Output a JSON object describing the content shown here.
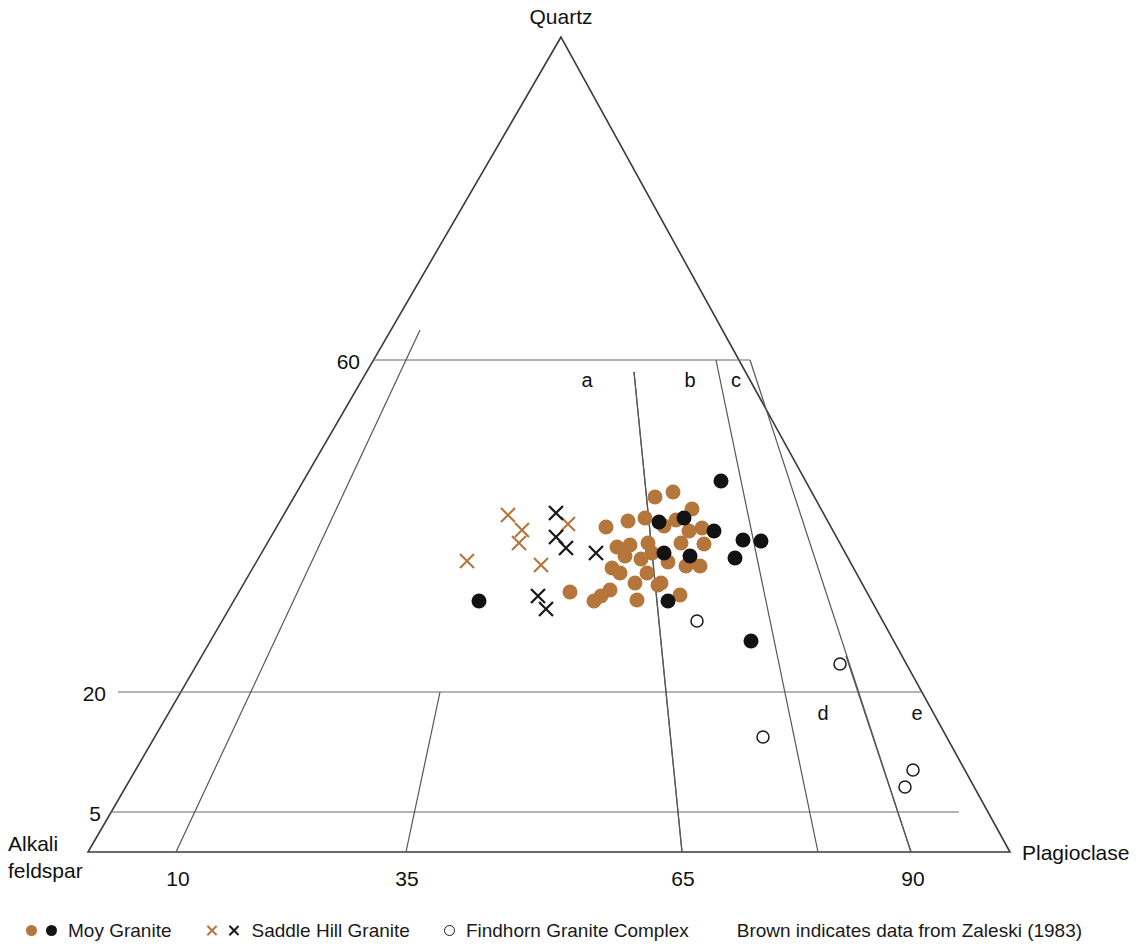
{
  "vertices": {
    "top": "Quartz",
    "bottom_left_line1": "Alkali",
    "bottom_left_line2": "feldspar",
    "bottom_right": "Plagioclase"
  },
  "axis_ticks": {
    "left": [
      "60",
      "20",
      "5"
    ],
    "bottom": [
      "10",
      "35",
      "65",
      "90"
    ]
  },
  "field_labels": [
    "a",
    "b",
    "c",
    "d",
    "e"
  ],
  "legend": {
    "items": [
      {
        "label": "Moy Granite",
        "markers": [
          "brown-filled-circle",
          "black-filled-circle"
        ]
      },
      {
        "label": "Saddle Hill Granite",
        "markers": [
          "brown-x",
          "black-x"
        ]
      },
      {
        "label": "Findhorn Granite Complex",
        "markers": [
          "open-circle"
        ]
      }
    ],
    "note": "Brown indicates data from Zaleski (1983)"
  },
  "colors": {
    "brown": "#b5763c",
    "black": "#121212",
    "line": "#3a3a3a",
    "grid": "#6b6b6b",
    "background": "#ffffff"
  },
  "chart_data": {
    "type": "scatter",
    "title": "",
    "subtitle": "",
    "plot_kind": "ternary QAP (Streckeisen) diagram",
    "apices": {
      "top": "Quartz",
      "left": "Alkali feldspar",
      "right": "Plagioclase"
    },
    "quartz_gridlines": [
      60,
      20,
      5
    ],
    "plagioclase_gridlines": [
      10,
      35,
      65,
      90
    ],
    "field_boundaries": [
      "a",
      "b",
      "c",
      "d",
      "e"
    ],
    "geometry_px": {
      "apex_top": [
        561,
        37
      ],
      "apex_left": [
        88,
        852
      ],
      "apex_right": [
        1010,
        852
      ]
    },
    "series": [
      {
        "name": "Moy Granite",
        "marker": "filled-circle",
        "color": "#b5763c",
        "note": "brown = data from Zaleski (1983)",
        "points_px": [
          [
            606,
            527
          ],
          [
            628,
            521
          ],
          [
            645,
            518
          ],
          [
            630,
            545
          ],
          [
            648,
            543
          ],
          [
            655,
            497
          ],
          [
            673,
            492
          ],
          [
            664,
            526
          ],
          [
            681,
            543
          ],
          [
            692,
            509
          ],
          [
            704,
            544
          ],
          [
            668,
            562
          ],
          [
            686,
            566
          ],
          [
            700,
            566
          ],
          [
            620,
            573
          ],
          [
            610,
            590
          ],
          [
            601,
            596
          ],
          [
            637,
            600
          ],
          [
            570,
            592
          ],
          [
            594,
            601
          ],
          [
            647,
            573
          ],
          [
            658,
            585
          ],
          [
            625,
            556
          ],
          [
            641,
            559
          ],
          [
            676,
            520
          ],
          [
            689,
            531
          ],
          [
            702,
            528
          ],
          [
            661,
            583
          ],
          [
            680,
            595
          ],
          [
            617,
            547
          ],
          [
            635,
            583
          ],
          [
            652,
            553
          ],
          [
            612,
            568
          ]
        ]
      },
      {
        "name": "Moy Granite",
        "marker": "filled-circle",
        "color": "#121212",
        "points_px": [
          [
            659,
            522
          ],
          [
            684,
            518
          ],
          [
            714,
            531
          ],
          [
            721,
            481
          ],
          [
            743,
            540
          ],
          [
            761,
            541
          ],
          [
            664,
            553
          ],
          [
            690,
            556
          ],
          [
            735,
            558
          ],
          [
            668,
            601
          ],
          [
            751,
            641
          ],
          [
            479,
            601
          ]
        ]
      },
      {
        "name": "Saddle Hill Granite",
        "marker": "x",
        "color": "#b5763c",
        "points_px": [
          [
            467,
            561
          ],
          [
            508,
            515
          ],
          [
            522,
            530
          ],
          [
            519,
            543
          ],
          [
            568,
            524
          ],
          [
            541,
            565
          ]
        ]
      },
      {
        "name": "Saddle Hill Granite",
        "marker": "x",
        "color": "#1a1a1a",
        "points_px": [
          [
            556,
            513
          ],
          [
            556,
            537
          ],
          [
            566,
            548
          ],
          [
            596,
            553
          ],
          [
            538,
            596
          ],
          [
            546,
            609
          ]
        ]
      },
      {
        "name": "Findhorn Granite Complex",
        "marker": "open-circle",
        "color": "#1a1a1a",
        "points_px": [
          [
            697,
            621
          ],
          [
            840,
            664
          ],
          [
            763,
            737
          ],
          [
            913,
            770
          ],
          [
            905,
            787
          ]
        ]
      }
    ]
  }
}
